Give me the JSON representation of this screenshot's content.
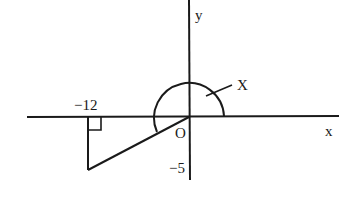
{
  "diagram": {
    "axes": {
      "x_label": "x",
      "y_label": "y",
      "origin_label": "O"
    },
    "point": {
      "x_label": "−12",
      "y_label": "−5",
      "x": -12,
      "y": -5
    },
    "angle_label": "X",
    "stroke_color": "#1a1a1a"
  }
}
